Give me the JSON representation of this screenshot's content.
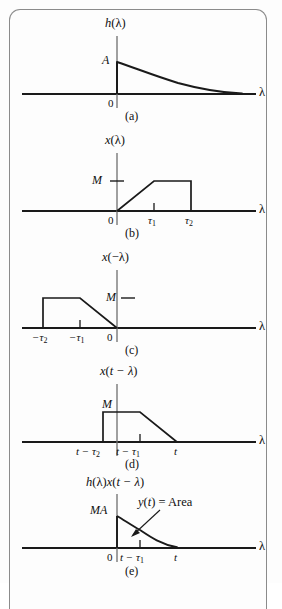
{
  "figure": {
    "background_color": "#fdfdfd",
    "line_color": "#1a1a1a",
    "axis_color": "#555555",
    "frame_color": "#8b8b8b"
  },
  "panels": [
    {
      "id": "a",
      "caption": "(a)",
      "title": "h(λ)",
      "title_parts": {
        "func": "h",
        "open": "(",
        "var": "λ",
        "close": ")"
      },
      "axis_label": "λ",
      "origin_label": "0",
      "amplitude_label": "A",
      "signal_type": "decaying-exponential",
      "description": "h(lambda) = A e^{-a lambda} for lambda >= 0, zero for lambda < 0",
      "ticks": [
        "0"
      ]
    },
    {
      "id": "b",
      "caption": "(b)",
      "title": "x(λ)",
      "title_parts": {
        "func": "x",
        "open": "(",
        "var": "λ",
        "close": ")"
      },
      "axis_label": "λ",
      "origin_label": "0",
      "amplitude_label": "M",
      "signal_type": "trapezoid-ramp-up",
      "description": "x(lambda): linear ramp 0 to M over [0, tau1], flat at M over [tau1, tau2], drops to 0 at tau2",
      "ticks": [
        "0",
        "τ₁",
        "τ₂"
      ],
      "tick_tau1": {
        "base": "τ",
        "sub": "1"
      },
      "tick_tau2": {
        "base": "τ",
        "sub": "2"
      }
    },
    {
      "id": "c",
      "caption": "(c)",
      "title": "x(−λ)",
      "title_parts": {
        "func": "x",
        "open": "(",
        "var": "−λ",
        "close": ")"
      },
      "axis_label": "λ",
      "origin_label": "0",
      "amplitude_label": "M",
      "signal_type": "trapezoid-reflected",
      "description": "x(-lambda): rises to M at -tau2, flat to -tau1, ramps down to 0 at 0",
      "ticks": [
        "−τ₂",
        "−τ₁",
        "0"
      ],
      "tick_neg_tau2": {
        "base": "−τ",
        "sub": "2"
      },
      "tick_neg_tau1": {
        "base": "−τ",
        "sub": "1"
      }
    },
    {
      "id": "d",
      "caption": "(d)",
      "title": "x(t − λ)",
      "title_parts": {
        "func": "x",
        "open": "(",
        "var": "t − λ",
        "close": ")"
      },
      "axis_label": "λ",
      "origin_label": "",
      "amplitude_label": "M",
      "signal_type": "trapezoid-shifted",
      "description": "x(t-lambda): rises to M at t-tau2, flat to t-tau1, ramps down to 0 at t",
      "ticks": [
        "t − τ₂",
        "t − τ₁",
        "t"
      ],
      "tick_t_tau2": {
        "base": "t − τ",
        "sub": "2"
      },
      "tick_t_tau1": {
        "base": "t − τ",
        "sub": "1"
      },
      "tick_t": "t"
    },
    {
      "id": "e",
      "caption": "(e)",
      "title": "h(λ)x(t − λ)",
      "title_parts": {
        "h": "h",
        "hopen": "(",
        "hvar": "λ",
        "hclose": ")",
        "x": "x",
        "xopen": "(",
        "xvar": "t − λ",
        "xclose": ")"
      },
      "axis_label": "λ",
      "origin_label": "0",
      "amplitude_label": "MA",
      "annotation": "y(t) = Area",
      "annotation_parts": {
        "y": "y",
        "open": "(",
        "var": "t",
        "close": ")",
        "eq": " = Area"
      },
      "signal_type": "product-decay",
      "description": "h(lambda)x(t-lambda): starts at MA at 0, decays with kink at t-tau1, reaches 0 at t",
      "ticks": [
        "0",
        "t − τ₁",
        "t"
      ],
      "tick_t_tau1": {
        "base": "t − τ",
        "sub": "1"
      },
      "tick_t": "t"
    }
  ]
}
